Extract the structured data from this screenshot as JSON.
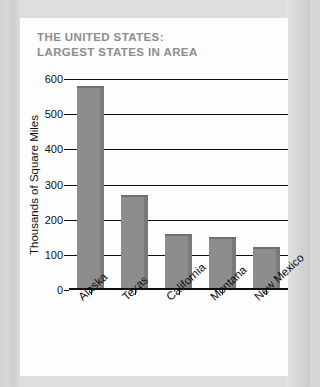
{
  "card": {
    "title": "THE UNITED STATES:\nLARGEST STATES IN AREA"
  },
  "chart_data": {
    "type": "bar",
    "title": "THE UNITED STATES: LARGEST STATES IN AREA",
    "xlabel": "",
    "ylabel": "Thousands of Square Miles",
    "categories": [
      "Alaska",
      "Texas",
      "California",
      "Montana",
      "New Mexico"
    ],
    "values": [
      580,
      270,
      160,
      150,
      122
    ],
    "ylim": [
      0,
      600
    ],
    "yticks": [
      0,
      100,
      200,
      300,
      400,
      500,
      600
    ],
    "ytick_labels": [
      "0",
      "100",
      "200",
      "300",
      "400",
      "500",
      "600"
    ],
    "grid": true,
    "legend": false,
    "legend_position": "none",
    "bar_color": "#8d8d8d",
    "bar_edge_color": "#7a7a7a",
    "axis_color": "#0d0d0d",
    "title_color": "#8c8c8c",
    "background_color": "#fdfdfd",
    "page_background_color": "#d8d8d8"
  }
}
